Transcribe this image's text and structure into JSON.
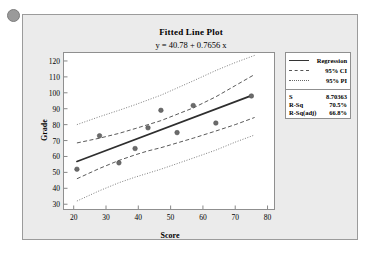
{
  "card": {
    "background_color": "#ebebeb",
    "border_color": "#9b9b9b"
  },
  "decor": {
    "bullet_name": "bullet-dot",
    "bullet_color": "#9a9a9a"
  },
  "legend": {
    "items": [
      {
        "label": "Regression",
        "style": "solid",
        "color": "#333333"
      },
      {
        "label": "95% CI",
        "style": "dashed",
        "color": "#555555"
      },
      {
        "label": "95% PI",
        "style": "dotted",
        "color": "#666666"
      }
    ]
  },
  "stats": {
    "rows": [
      {
        "key": "S",
        "value": "8.70363"
      },
      {
        "key": "R-Sq",
        "value": "70.5%"
      },
      {
        "key": "R-Sq(adj)",
        "value": "66.8%"
      }
    ]
  },
  "chart_data": {
    "type": "scatter",
    "title": "Fitted Line Plot",
    "subtitle": "y = 40.78 + 0.7656 x",
    "xlabel": "Score",
    "ylabel": "Grade",
    "xlim": [
      17,
      82
    ],
    "ylim": [
      27,
      125
    ],
    "xticks": [
      20,
      30,
      40,
      50,
      60,
      70,
      80
    ],
    "yticks": [
      30,
      40,
      50,
      60,
      70,
      80,
      90,
      100,
      110,
      120
    ],
    "grid": false,
    "legend_position": "right",
    "regression": {
      "intercept": 40.78,
      "slope": 0.7656,
      "s": 8.70363,
      "r_sq": 70.5,
      "r_sq_adj": 66.8
    },
    "points": [
      {
        "x": 21,
        "y": 52
      },
      {
        "x": 28,
        "y": 73
      },
      {
        "x": 34,
        "y": 56
      },
      {
        "x": 39,
        "y": 65
      },
      {
        "x": 43,
        "y": 78
      },
      {
        "x": 47,
        "y": 89
      },
      {
        "x": 52,
        "y": 75
      },
      {
        "x": 57,
        "y": 92
      },
      {
        "x": 64,
        "y": 81
      },
      {
        "x": 75,
        "y": 98
      }
    ],
    "point_color": "#6b6b6b",
    "ci_band": {
      "name": "95% CI",
      "x": [
        21,
        28,
        34,
        39,
        43,
        47,
        52,
        57,
        64,
        70,
        76
      ],
      "upper": [
        68.5,
        71.5,
        74.5,
        77.5,
        80.0,
        82.5,
        86.5,
        90.5,
        97.5,
        104.5,
        111.5
      ],
      "lower": [
        46.0,
        52.5,
        57.5,
        61.0,
        63.5,
        65.5,
        68.5,
        71.5,
        76.0,
        80.0,
        84.5
      ]
    },
    "pi_band": {
      "name": "95% PI",
      "x": [
        21,
        28,
        34,
        39,
        43,
        47,
        52,
        57,
        64,
        70,
        76
      ],
      "upper": [
        80.0,
        85.0,
        89.0,
        92.5,
        95.5,
        98.5,
        103.0,
        107.5,
        114.0,
        119.0,
        123.5
      ],
      "lower": [
        32.0,
        38.5,
        43.5,
        47.0,
        49.5,
        52.0,
        55.5,
        59.0,
        64.0,
        69.0,
        73.5
      ]
    }
  }
}
